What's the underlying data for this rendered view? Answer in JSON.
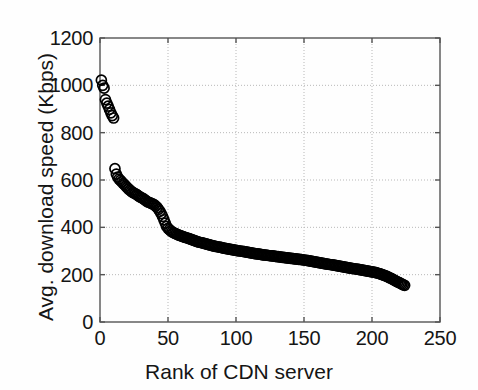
{
  "chart_data": {
    "type": "scatter",
    "title": "",
    "xlabel": "Rank of CDN server",
    "ylabel": "Avg. download speed (Kbps)",
    "xlim": [
      0,
      250
    ],
    "ylim": [
      0,
      1200
    ],
    "xticks": [
      0,
      50,
      100,
      150,
      200,
      250
    ],
    "yticks": [
      0,
      200,
      400,
      600,
      800,
      1000,
      1200
    ],
    "grid": true,
    "legend": null,
    "marker": "open-circle",
    "marker_color": "#000000",
    "marker_size": 5,
    "x": [
      1,
      2,
      3,
      4,
      5,
      6,
      7,
      8,
      9,
      10,
      11,
      12,
      13,
      14,
      15,
      16,
      17,
      18,
      19,
      20,
      21,
      22,
      23,
      24,
      25,
      26,
      27,
      28,
      29,
      30,
      31,
      32,
      33,
      34,
      35,
      36,
      37,
      38,
      39,
      40,
      41,
      42,
      43,
      44,
      45,
      46,
      47,
      48,
      49,
      50,
      51,
      52,
      53,
      54,
      55,
      56,
      57,
      58,
      59,
      60,
      61,
      62,
      63,
      64,
      65,
      66,
      67,
      68,
      69,
      70,
      71,
      72,
      73,
      74,
      75,
      76,
      77,
      78,
      79,
      80,
      81,
      82,
      83,
      84,
      85,
      86,
      87,
      88,
      89,
      90,
      91,
      92,
      93,
      94,
      95,
      96,
      97,
      98,
      99,
      100,
      101,
      102,
      103,
      104,
      105,
      106,
      107,
      108,
      109,
      110,
      111,
      112,
      113,
      114,
      115,
      116,
      117,
      118,
      119,
      120,
      121,
      122,
      123,
      124,
      125,
      126,
      127,
      128,
      129,
      130,
      131,
      132,
      133,
      134,
      135,
      136,
      137,
      138,
      139,
      140,
      141,
      142,
      143,
      144,
      145,
      146,
      147,
      148,
      149,
      150,
      151,
      152,
      153,
      154,
      155,
      156,
      157,
      158,
      159,
      160,
      161,
      162,
      163,
      164,
      165,
      166,
      167,
      168,
      169,
      170,
      171,
      172,
      173,
      174,
      175,
      176,
      177,
      178,
      179,
      180,
      181,
      182,
      183,
      184,
      185,
      186,
      187,
      188,
      189,
      190,
      191,
      192,
      193,
      194,
      195,
      196,
      197,
      198,
      199,
      200,
      201,
      202,
      203,
      204,
      205,
      206,
      207,
      208,
      209,
      210,
      211,
      212,
      213,
      214,
      215,
      216,
      217,
      218,
      219,
      220,
      221,
      222,
      223,
      224
    ],
    "y": [
      1022,
      1000,
      988,
      940,
      925,
      912,
      898,
      884,
      872,
      862,
      648,
      625,
      612,
      604,
      598,
      592,
      586,
      580,
      574,
      568,
      562,
      557,
      552,
      548,
      545,
      542,
      538,
      534,
      530,
      527,
      524,
      520,
      516,
      512,
      508,
      505,
      503,
      500,
      498,
      495,
      490,
      484,
      476,
      468,
      458,
      446,
      432,
      418,
      404,
      396,
      390,
      385,
      381,
      378,
      375,
      372,
      369,
      367,
      365,
      363,
      361,
      359,
      357,
      355,
      353,
      351,
      349,
      347,
      345,
      343,
      341,
      339,
      337,
      336,
      334,
      333,
      331,
      330,
      328,
      327,
      325,
      324,
      322,
      321,
      320,
      318,
      317,
      316,
      315,
      313,
      312,
      311,
      310,
      309,
      308,
      307,
      306,
      305,
      304,
      303,
      302,
      301,
      300,
      299,
      298,
      297,
      296,
      295,
      294,
      293,
      292,
      291,
      290,
      289,
      288,
      288,
      287,
      286,
      285,
      284,
      283,
      283,
      282,
      281,
      280,
      279,
      279,
      278,
      277,
      276,
      276,
      275,
      274,
      273,
      273,
      272,
      271,
      271,
      270,
      269,
      269,
      268,
      267,
      267,
      266,
      265,
      265,
      264,
      263,
      262,
      261,
      260,
      259,
      258,
      257,
      256,
      255,
      254,
      253,
      252,
      251,
      250,
      249,
      248,
      247,
      246,
      245,
      244,
      243,
      242,
      241,
      240,
      239,
      238,
      237,
      236,
      235,
      234,
      233,
      232,
      231,
      230,
      229,
      228,
      227,
      226,
      225,
      224,
      223,
      222,
      221,
      220,
      219,
      218,
      217,
      216,
      215,
      214,
      213,
      212,
      211,
      210,
      209,
      207,
      205,
      203,
      201,
      199,
      197,
      195,
      193,
      190,
      187,
      184,
      181,
      178,
      175,
      172,
      169,
      166,
      163,
      160,
      157,
      155
    ]
  },
  "axes": {
    "ytick_labels": [
      "1200",
      "1000",
      "800",
      "600",
      "400",
      "200",
      "0"
    ],
    "ytick_values": [
      1200,
      1000,
      800,
      600,
      400,
      200,
      0
    ],
    "xtick_labels": [
      "0",
      "50",
      "100",
      "150",
      "200",
      "250"
    ],
    "xtick_values": [
      0,
      50,
      100,
      150,
      200,
      250
    ]
  },
  "colors": {
    "marker": "#000000",
    "axis": "#555555",
    "grid": "#b8b8b8",
    "text": "#151515",
    "background": "#ffffff"
  }
}
